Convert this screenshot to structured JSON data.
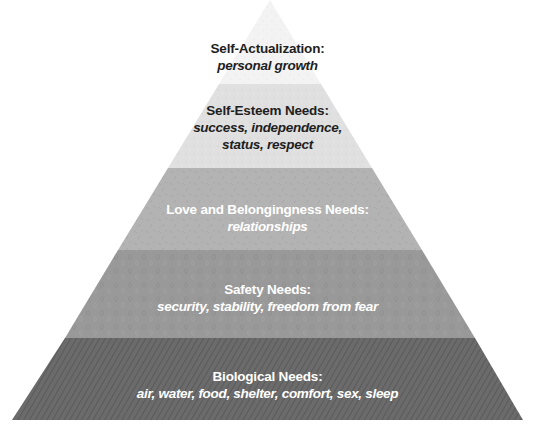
{
  "diagram": {
    "type": "pyramid",
    "layers": [
      {
        "id": "self-actualization",
        "title": "Self-Actualization:",
        "description_lines": [
          "personal growth"
        ],
        "fill": "#f3f3f3",
        "text_color": "#1e1e1e"
      },
      {
        "id": "self-esteem",
        "title": "Self-Esteem Needs:",
        "description_lines": [
          "success, independence,",
          "status, respect"
        ],
        "fill": "#e0e0e0",
        "text_color": "#1e1e1e"
      },
      {
        "id": "love-belonging",
        "title": "Love and Belongingness Needs:",
        "description_lines": [
          "relationships"
        ],
        "fill": "#b3b3b3",
        "text_color": "#ffffff"
      },
      {
        "id": "safety",
        "title": "Safety Needs:",
        "description_lines": [
          "security, stability, freedom from fear"
        ],
        "fill": "#999999",
        "text_color": "#ffffff"
      },
      {
        "id": "biological",
        "title": "Biological Needs:",
        "description_lines": [
          "air, water, food, shelter, comfort, sex, sleep"
        ],
        "fill": "#6b6b6b",
        "text_color": "#ffffff"
      }
    ]
  }
}
